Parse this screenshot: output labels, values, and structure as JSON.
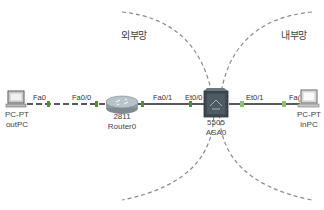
{
  "zones": {
    "external": {
      "label": "외부망"
    },
    "internal": {
      "label": "내부망"
    }
  },
  "devices": {
    "outPC": {
      "model": "PC-PT",
      "name": "outPC",
      "icon": "pc-icon"
    },
    "router0": {
      "model": "2811",
      "name": "Router0",
      "icon": "router-icon"
    },
    "asa0": {
      "model": "5505",
      "name": "ASA0",
      "icon": "firewall-icon"
    },
    "inPC": {
      "model": "PC-PT",
      "name": "inPC",
      "icon": "pc-icon"
    }
  },
  "links": [
    {
      "from": "outPC",
      "from_port": "Fa0",
      "to": "router0",
      "to_port": "Fa0/0",
      "style": "crossover-dashed"
    },
    {
      "from": "router0",
      "from_port": "Fa0/1",
      "to": "asa0",
      "to_port": "Et0/0",
      "style": "straight"
    },
    {
      "from": "asa0",
      "from_port": "Et0/1",
      "to": "inPC",
      "to_port": "Fa0",
      "style": "straight"
    }
  ],
  "port_labels": {
    "outpc_fa0": "Fa0",
    "router_fa00": "Fa0/0",
    "router_fa01": "Fa0/1",
    "asa_et00": "Et0/0",
    "asa_et01": "Et0/1",
    "inpc_fa0": "Fa("
  },
  "colors": {
    "link": "#222222",
    "zone_border": "#8a8a8a",
    "connector": "#6ab04c"
  }
}
